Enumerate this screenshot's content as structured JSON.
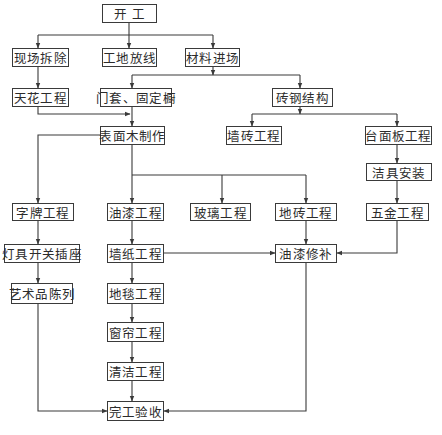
{
  "diagram": {
    "type": "flowchart",
    "title": "",
    "nodes": [
      {
        "id": "start",
        "label": "开  工"
      },
      {
        "id": "demolition",
        "label": "现场拆除"
      },
      {
        "id": "layout",
        "label": "工地放线"
      },
      {
        "id": "materials",
        "label": "材料进场"
      },
      {
        "id": "ceiling",
        "label": "天花工程"
      },
      {
        "id": "doorframe",
        "label": "门套、固定橱"
      },
      {
        "id": "brick_steel",
        "label": "砖钢结构"
      },
      {
        "id": "wood_surface",
        "label": "表面木制作"
      },
      {
        "id": "wall_tile",
        "label": "墙砖工程"
      },
      {
        "id": "countertop",
        "label": "台面板工程"
      },
      {
        "id": "sanitary",
        "label": "洁具安装"
      },
      {
        "id": "signage",
        "label": "字牌工程"
      },
      {
        "id": "paint",
        "label": "油漆工程"
      },
      {
        "id": "glass",
        "label": "玻璃工程"
      },
      {
        "id": "floor_tile",
        "label": "地砖工程"
      },
      {
        "id": "hardware",
        "label": "五金工程"
      },
      {
        "id": "lighting",
        "label": "灯具开关插座"
      },
      {
        "id": "wallpaper",
        "label": "墙纸工程"
      },
      {
        "id": "paint_touchup",
        "label": "油漆修补"
      },
      {
        "id": "artwork",
        "label": "艺术品陈列"
      },
      {
        "id": "carpet",
        "label": "地毯工程"
      },
      {
        "id": "curtain",
        "label": "窗帘工程"
      },
      {
        "id": "cleaning",
        "label": "清洁工程"
      },
      {
        "id": "acceptance",
        "label": "完工验收"
      }
    ],
    "edges": [
      [
        "start",
        "demolition"
      ],
      [
        "start",
        "layout"
      ],
      [
        "start",
        "materials"
      ],
      [
        "demolition",
        "ceiling"
      ],
      [
        "materials",
        "doorframe"
      ],
      [
        "materials",
        "brick_steel"
      ],
      [
        "ceiling",
        "wood_surface"
      ],
      [
        "doorframe",
        "wood_surface"
      ],
      [
        "brick_steel",
        "wall_tile"
      ],
      [
        "brick_steel",
        "countertop"
      ],
      [
        "countertop",
        "sanitary"
      ],
      [
        "sanitary",
        "hardware"
      ],
      [
        "wood_surface",
        "signage"
      ],
      [
        "wood_surface",
        "paint"
      ],
      [
        "wood_surface",
        "glass"
      ],
      [
        "wood_surface",
        "floor_tile"
      ],
      [
        "signage",
        "lighting"
      ],
      [
        "lighting",
        "artwork"
      ],
      [
        "artwork",
        "acceptance"
      ],
      [
        "paint",
        "wallpaper"
      ],
      [
        "wallpaper",
        "carpet"
      ],
      [
        "carpet",
        "curtain"
      ],
      [
        "curtain",
        "cleaning"
      ],
      [
        "cleaning",
        "acceptance"
      ],
      [
        "wallpaper",
        "paint_touchup"
      ],
      [
        "floor_tile",
        "paint_touchup"
      ],
      [
        "hardware",
        "paint_touchup"
      ],
      [
        "paint_touchup",
        "acceptance"
      ]
    ]
  }
}
